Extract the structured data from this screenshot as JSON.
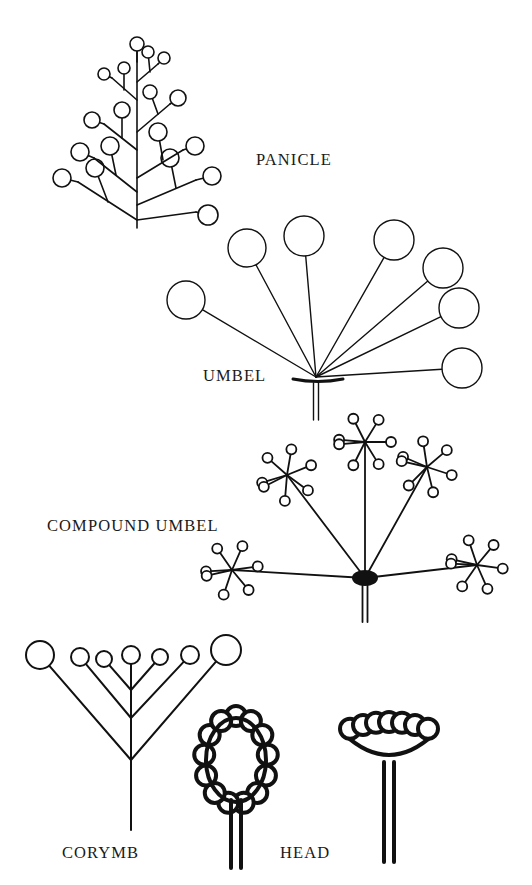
{
  "figure": {
    "background_color": "#ffffff",
    "ink_color": "#111111",
    "labels": {
      "panicle": "PANICLE",
      "umbel": "UMBEL",
      "compound_umbel": "COMPOUND UMBEL",
      "corymb": "CORYMB",
      "head": "HEAD"
    }
  },
  "diagrams": {
    "panicle": {
      "name": "panicle",
      "label": "PANICLE",
      "label_position": {
        "x": 256,
        "y": 152
      },
      "axis": {
        "x": 137,
        "y_base": 228,
        "y_top": 46
      },
      "stroke_width": 1.6,
      "description": "Branched raceme; lower branches longer and re-branched, flowers larger toward base",
      "flower_count": 28,
      "flower_radius_range": [
        5,
        10
      ],
      "branches": [
        {
          "from": [
            137,
            220
          ],
          "to": [
            78,
            182
          ],
          "flowers": [
            [
              62,
              178,
              9
            ]
          ],
          "sub": [
            [
              108,
              202,
              95,
              168,
              9
            ]
          ]
        },
        {
          "from": [
            137,
            220
          ],
          "to": [
            196,
            212
          ],
          "flowers": [
            [
              208,
              215,
              10
            ]
          ],
          "sub": []
        },
        {
          "from": [
            137,
            205
          ],
          "to": [
            196,
            180
          ],
          "flowers": [
            [
              212,
              176,
              9
            ]
          ],
          "sub": [
            [
              176,
              188,
              170,
              158,
              9
            ]
          ]
        },
        {
          "from": [
            137,
            192
          ],
          "to": [
            94,
            158
          ],
          "flowers": [
            [
              80,
              152,
              9
            ]
          ],
          "sub": [
            [
              116,
              175,
              110,
              146,
              9
            ]
          ]
        },
        {
          "from": [
            137,
            178
          ],
          "to": [
            183,
            150
          ],
          "flowers": [
            [
              195,
              146,
              9
            ]
          ],
          "sub": [
            [
              163,
              160,
              158,
              132,
              9
            ]
          ]
        },
        {
          "from": [
            137,
            150
          ],
          "to": [
            104,
            124
          ],
          "flowers": [
            [
              92,
              120,
              8
            ]
          ],
          "sub": [
            [
              122,
              138,
              122,
              110,
              8
            ]
          ]
        },
        {
          "from": [
            137,
            132
          ],
          "to": [
            170,
            104
          ],
          "flowers": [
            [
              178,
              98,
              8
            ]
          ],
          "sub": [
            [
              158,
              114,
              150,
              92,
              7
            ]
          ]
        },
        {
          "from": [
            137,
            100
          ],
          "to": [
            112,
            78
          ],
          "flowers": [
            [
              104,
              74,
              6
            ]
          ],
          "sub": [
            [
              124,
              90,
              124,
              68,
              6
            ]
          ]
        },
        {
          "from": [
            137,
            82
          ],
          "to": [
            158,
            64
          ],
          "flowers": [
            [
              164,
              58,
              6
            ]
          ],
          "sub": [
            [
              150,
              72,
              148,
              52,
              6
            ]
          ]
        },
        {
          "from": [
            137,
            62
          ],
          "to": [
            137,
            48
          ],
          "flowers": [
            [
              137,
              44,
              7
            ]
          ],
          "sub": []
        }
      ]
    },
    "umbel": {
      "name": "umbel",
      "label": "UMBEL",
      "label_position": {
        "x": 203,
        "y": 368
      },
      "hub": {
        "x": 316,
        "y": 377
      },
      "stroke_width": 1.4,
      "description": "Simple umbel: all pedicels arise from one point, subtended by an involucre, on a stout double-line peduncle",
      "ray_count": 8,
      "involucre": {
        "x1": 293,
        "x2": 343,
        "y": 379
      },
      "peduncle": {
        "x": 316,
        "y_top": 383,
        "y_bottom": 420,
        "double_line": true
      },
      "rays": [
        {
          "tip": [
            186,
            300
          ],
          "radius": 19
        },
        {
          "tip": [
            247,
            248
          ],
          "radius": 19
        },
        {
          "tip": [
            304,
            236
          ],
          "radius": 20
        },
        {
          "tip": [
            394,
            240
          ],
          "radius": 20
        },
        {
          "tip": [
            443,
            268
          ],
          "radius": 20
        },
        {
          "tip": [
            459,
            308
          ],
          "radius": 20
        },
        {
          "tip": [
            462,
            368
          ],
          "radius": 20
        },
        {
          "tip": [
            414,
            372
          ],
          "radius": 0
        }
      ]
    },
    "compound_umbel": {
      "name": "compound_umbel",
      "label": "COMPOUND UMBEL",
      "label_position": {
        "x": 47,
        "y": 518
      },
      "hub": {
        "x": 365,
        "y": 578
      },
      "stroke_width": 1.8,
      "description": "Umbel of umbels: primary rays each terminate in a secondary umbel (umbellet) of ~7 florets; central hub drawn as a solid blob",
      "primary_ray_count": 5,
      "florets_per_umbellet": 7,
      "floret_radius": 5,
      "peduncle": {
        "x": 365,
        "y_top": 584,
        "y_bottom": 622,
        "double_line": true
      },
      "umbellets": [
        {
          "center": [
            365,
            442
          ],
          "rotation": 0
        },
        {
          "center": [
            287,
            475
          ],
          "rotation": -22
        },
        {
          "center": [
            427,
            467
          ],
          "rotation": 18
        },
        {
          "center": [
            232,
            570
          ],
          "rotation": -8
        },
        {
          "center": [
            477,
            565
          ],
          "rotation": 8
        }
      ]
    },
    "corymb": {
      "name": "corymb",
      "label": "CORYMB",
      "label_position": {
        "x": 62,
        "y": 845
      },
      "axis": {
        "x": 131,
        "y_base": 830,
        "y_top": 660
      },
      "stroke_width": 2.0,
      "description": "Flat-topped raceme; lower pedicels longest so all flowers reach about the same level",
      "flower_count": 7,
      "pedicels": [
        {
          "node": [
            131,
            760
          ],
          "tip": [
            40,
            655
          ],
          "radius": 14
        },
        {
          "node": [
            131,
            760
          ],
          "tip": [
            226,
            650
          ],
          "radius": 15
        },
        {
          "node": [
            131,
            718
          ],
          "tip": [
            80,
            657
          ],
          "radius": 9
        },
        {
          "node": [
            131,
            718
          ],
          "tip": [
            190,
            655
          ],
          "radius": 9
        },
        {
          "node": [
            131,
            690
          ],
          "tip": [
            104,
            659
          ],
          "radius": 8
        },
        {
          "node": [
            131,
            690
          ],
          "tip": [
            160,
            657
          ],
          "radius": 8
        },
        {
          "node": [
            131,
            690
          ],
          "tip": [
            131,
            655
          ],
          "radius": 9
        }
      ]
    },
    "head_oval": {
      "name": "head-oval",
      "label": "HEAD",
      "description": "Capitulum with an elongate (conical) receptacle ringed by sessile florets",
      "receptacle": {
        "cx": 236,
        "cy": 760,
        "rx": 30,
        "ry": 42,
        "shape": "oval"
      },
      "stroke_width": 4,
      "floret_count": 13,
      "floret_radius": 10,
      "peduncle": {
        "x": 236,
        "y_top": 800,
        "y_bottom": 868,
        "double_line": true
      }
    },
    "head_flat": {
      "name": "head-flat",
      "label": "HEAD",
      "label_position": {
        "x": 280,
        "y": 845
      },
      "description": "Capitulum with a flat/saucer receptacle; sessile florets crowded across the top",
      "receptacle": {
        "cx": 389,
        "cy": 742,
        "rx": 45,
        "ry": 28,
        "shape": "flat-disc"
      },
      "stroke_width": 4,
      "floret_count": 7,
      "floret_radius": 10,
      "peduncle": {
        "x": 389,
        "y_top": 762,
        "y_bottom": 862,
        "double_line": true
      }
    }
  }
}
